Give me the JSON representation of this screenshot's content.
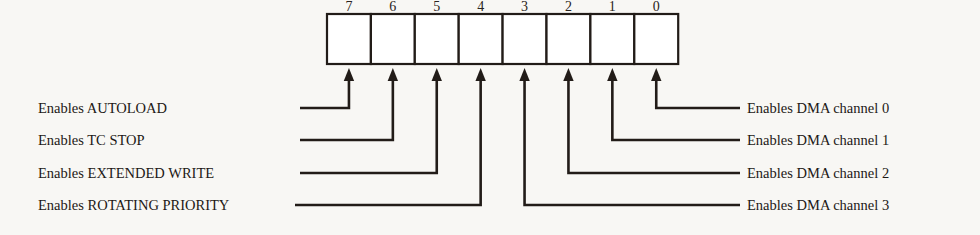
{
  "diagram": {
    "register": {
      "bit_count": 8,
      "bit_numbers": [
        "7",
        "6",
        "5",
        "4",
        "3",
        "2",
        "1",
        "0"
      ]
    },
    "colors": {
      "background": "#f8f7f4",
      "cell_fill": "#ffffff",
      "line": "#221c18",
      "text": "#1d1916"
    },
    "left_labels": [
      {
        "text": "Enables AUTOLOAD",
        "bit": "7"
      },
      {
        "text": "Enables TC STOP",
        "bit": "6"
      },
      {
        "text": "Enables EXTENDED WRITE",
        "bit": "5"
      },
      {
        "text": "Enables ROTATING PRIORITY",
        "bit": "4"
      }
    ],
    "right_labels": [
      {
        "text": "Enables DMA channel 0",
        "bit": "0"
      },
      {
        "text": "Enables DMA channel 1",
        "bit": "1"
      },
      {
        "text": "Enables DMA channel 2",
        "bit": "2"
      },
      {
        "text": "Enables DMA channel 3",
        "bit": "3"
      }
    ]
  },
  "geometry": {
    "box_left": 327,
    "box_top": 14,
    "box_bottom": 64,
    "cell_width": 43.9,
    "arrow_tip_y": 68,
    "rows_y": [
      108,
      140,
      173,
      205
    ],
    "left_leader_start_x": [
      300,
      300,
      300,
      295
    ],
    "left_label_x": 38,
    "right_leader_end_x": 740,
    "right_label_x": 747,
    "bit_number_y": 11,
    "left_arrow_bit_index": [
      0,
      1,
      2,
      3
    ],
    "right_arrow_bit_index": [
      7,
      6,
      5,
      4
    ]
  }
}
